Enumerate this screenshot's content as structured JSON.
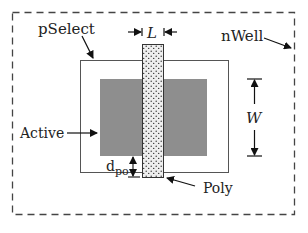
{
  "diagram": {
    "labels": {
      "pselect": "pSelect",
      "nwell": "nWell",
      "active": "Active",
      "poly": "Poly",
      "length": "L",
      "width": "W",
      "dpo_main": "d",
      "dpo_sub": "po"
    },
    "colors": {
      "active_fill": "#8e8e8e",
      "poly_fill": "#eeeeee",
      "poly_dots": "#333333",
      "outline": "#555555",
      "nwell_dash": "#444444"
    }
  }
}
